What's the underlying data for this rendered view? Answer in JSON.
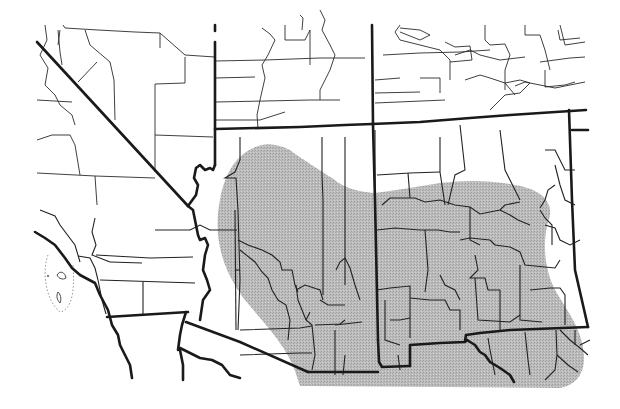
{
  "map": {
    "title": "",
    "region": "Southwestern United States",
    "range_fill_color": "#b3b3b3",
    "line_color": "#1a1a1a",
    "background_color": "#ffffff",
    "features": [
      {
        "name": "shaded-distribution-range",
        "description": "Gray stippled range covering central/southern Arizona and southern New Mexico into Texas"
      },
      {
        "name": "state-borders",
        "description": "Heavy black state boundary lines"
      },
      {
        "name": "county-borders",
        "description": "Thin county boundary lines"
      },
      {
        "name": "channel-islands",
        "description": "Small offshore islands with dotted boundary off southern California"
      }
    ]
  }
}
